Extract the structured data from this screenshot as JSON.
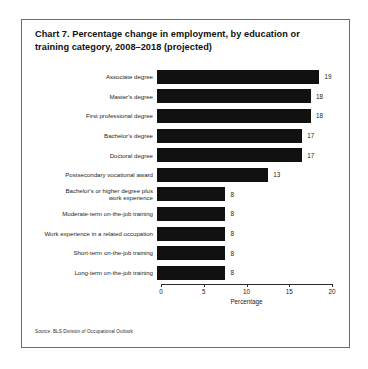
{
  "figure": {
    "title": "Chart 7. Percentage change in employment, by education or training category, 2008–2018 (projected)",
    "source": "Source: BLS Division of Occupational Outlook"
  },
  "chart_data": {
    "type": "bar",
    "orientation": "horizontal",
    "title": "Chart 7. Percentage change in employment, by education or training category, 2008–2018 (projected)",
    "xlabel": "Percentage",
    "ylabel": "",
    "xlim": [
      0,
      20
    ],
    "xticks": [
      0,
      5,
      10,
      15,
      20
    ],
    "xtick_labels": [
      "0",
      "5",
      "10",
      "15",
      "20"
    ],
    "grid": false,
    "legend": null,
    "bar_color": "#111111",
    "categories": [
      "Associate degree",
      "Master's degree",
      "First professional degree",
      "Bachelor's degree",
      "Doctoral degree",
      "Postsecondary vocational award",
      "Bachelor's or higher degree plus\nwork experience",
      "Moderate-term on-the-job training",
      "Work experience in a related occupation",
      "Short-term on-the-job training",
      "Long-term on-the-job training"
    ],
    "values": [
      19,
      18,
      18,
      17,
      17,
      13,
      8,
      8,
      8,
      8,
      8
    ],
    "value_labels": [
      "19",
      "18",
      "18",
      "17",
      "17",
      "13",
      "8",
      "8",
      "8",
      "8",
      "8"
    ]
  }
}
